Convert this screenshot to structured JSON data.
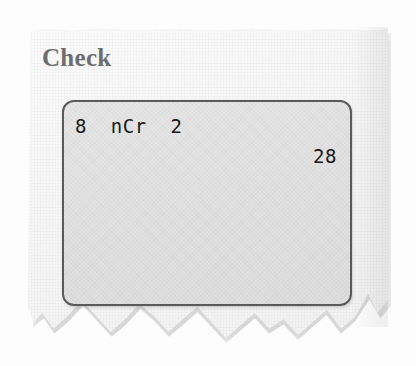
{
  "page": {
    "background_color": "#fdfdfd",
    "paper_color": "#f6f6f6"
  },
  "heading": {
    "text": "Check",
    "color": "#6e6e6e"
  },
  "calculator": {
    "screen_fill_color": "#e1e1e1",
    "screen_border_color": "#5a5a5a",
    "text_color": "#191919",
    "lines": [
      {
        "text": "8  nCr  2",
        "align": "left",
        "name": "calc-entry-line"
      },
      {
        "text": "28",
        "align": "right",
        "name": "calc-result-line"
      }
    ],
    "entry": "8  nCr  2",
    "result": "28"
  }
}
